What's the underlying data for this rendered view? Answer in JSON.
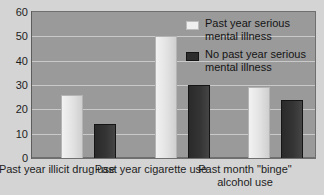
{
  "chart_data": {
    "type": "bar",
    "title": "",
    "xlabel": "",
    "ylabel": "",
    "ylim": [
      0,
      60
    ],
    "yticks": [
      0,
      10,
      20,
      30,
      40,
      50,
      60
    ],
    "grid": true,
    "legend_position": "inside-top-right",
    "categories": [
      "Past year\nillicit drug use",
      "Past year\ncigarette use",
      "Past month\n\"binge\" alcohol use"
    ],
    "series": [
      {
        "name": "Past year serious mental illness",
        "color": "#f0f0f0",
        "values": [
          26,
          50,
          29
        ]
      },
      {
        "name": "No past year serious mental illness",
        "color": "#2c2c2c",
        "values": [
          14,
          30,
          24
        ]
      }
    ]
  },
  "axis": {
    "tick_labels": [
      "60",
      "50",
      "40",
      "30",
      "20",
      "10",
      "0"
    ]
  },
  "legend": {
    "items": [
      {
        "label": "Past year serious\nmental illness",
        "swatch": "light"
      },
      {
        "label": "No past year serious\nmental illness",
        "swatch": "dark"
      }
    ]
  },
  "colors": {
    "plot_background": "#9a9a9a",
    "page_background": "#d4d4d4",
    "gridline": "#c9c9c9",
    "axis": "#5d5d5d"
  }
}
